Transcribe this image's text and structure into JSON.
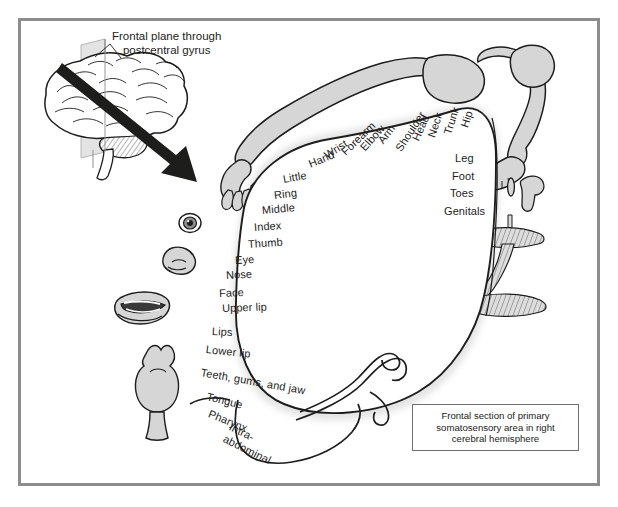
{
  "figure": {
    "type": "anatomical-diagram",
    "callout": {
      "line1": "Frontal plane through",
      "line2": "postcentral gyrus"
    },
    "caption": {
      "line1": "Frontal section of primary",
      "line2": "somatosensory area in right",
      "line3": "cerebral hemisphere"
    },
    "colors": {
      "frame": "#8d8d8d",
      "outline": "#1d1d1b",
      "body_fill": "#d6d6d6",
      "cortex_fill": "#ffffff",
      "shadow": "#e9e9e9",
      "text": "#1d1d1b"
    },
    "labels_medial": [
      {
        "text": "Hip",
        "x": 464,
        "y": 121,
        "rot": -72,
        "size": 11
      },
      {
        "text": "Trunk",
        "x": 447,
        "y": 128,
        "rot": -72,
        "size": 11
      },
      {
        "text": "Neck",
        "x": 431,
        "y": 131,
        "rot": -72,
        "size": 11
      },
      {
        "text": "Head",
        "x": 415,
        "y": 134,
        "rot": -66,
        "size": 11
      },
      {
        "text": "Shoulder",
        "x": 398,
        "y": 144,
        "rot": -57,
        "size": 11
      },
      {
        "text": "Arm",
        "x": 380,
        "y": 136,
        "rot": -52,
        "size": 11
      },
      {
        "text": "Elbow",
        "x": 362,
        "y": 143,
        "rot": -48,
        "size": 11
      },
      {
        "text": "Forearm",
        "x": 343,
        "y": 147,
        "rot": -44,
        "size": 11
      },
      {
        "text": "Wrist",
        "x": 325,
        "y": 150,
        "rot": -33,
        "size": 11
      },
      {
        "text": "Hand",
        "x": 309,
        "y": 158,
        "rot": -22,
        "size": 11
      }
    ],
    "labels_lateral_right": [
      {
        "text": "Leg",
        "x": 455,
        "y": 152,
        "rot": 0,
        "size": 11
      },
      {
        "text": "Foot",
        "x": 452,
        "y": 170,
        "rot": 0,
        "size": 11
      },
      {
        "text": "Toes",
        "x": 450,
        "y": 187,
        "rot": 0,
        "size": 11
      },
      {
        "text": "Genitals",
        "x": 444,
        "y": 205,
        "rot": 0,
        "size": 11
      }
    ],
    "labels_lateral_left": [
      {
        "text": "Little",
        "x": 283,
        "y": 173,
        "rot": -10,
        "size": 11
      },
      {
        "text": "Ring",
        "x": 274,
        "y": 189,
        "rot": -7,
        "size": 11
      },
      {
        "text": "Middle",
        "x": 262,
        "y": 204,
        "rot": -5,
        "size": 11
      },
      {
        "text": "Index",
        "x": 254,
        "y": 221,
        "rot": -4,
        "size": 11
      },
      {
        "text": "Thumb",
        "x": 248,
        "y": 238,
        "rot": -4,
        "size": 11
      },
      {
        "text": "Eye",
        "x": 235,
        "y": 254,
        "rot": -3,
        "size": 11
      },
      {
        "text": "Nose",
        "x": 226,
        "y": 269,
        "rot": -3,
        "size": 11
      },
      {
        "text": "Face",
        "x": 219,
        "y": 287,
        "rot": -2,
        "size": 11
      },
      {
        "text": "Upper lip",
        "x": 222,
        "y": 302,
        "rot": -2,
        "size": 11
      },
      {
        "text": "Lips",
        "x": 212,
        "y": 325,
        "rot": 3,
        "size": 11
      },
      {
        "text": "Lower lip",
        "x": 206,
        "y": 343,
        "rot": 6,
        "size": 11
      },
      {
        "text": "Teeth, gums, and jaw",
        "x": 201,
        "y": 366,
        "rot": 10,
        "size": 11
      },
      {
        "text": "Tongue",
        "x": 207,
        "y": 390,
        "rot": 14,
        "size": 11
      },
      {
        "text": "Pharynx",
        "x": 209,
        "y": 407,
        "rot": 22,
        "size": 11
      },
      {
        "text": "Intra-",
        "x": 230,
        "y": 420,
        "rot": 26,
        "size": 11
      },
      {
        "text": "abdominal",
        "x": 224,
        "y": 432,
        "rot": 26,
        "size": 11
      }
    ],
    "body_parts_drawn": [
      "arm-and-hand",
      "leg-and-foot",
      "genitals",
      "eye",
      "nose",
      "lips-and-mouth",
      "tongue-and-pharynx",
      "teeth-jaw-structure"
    ],
    "brain_inset": {
      "name": "lateral-brain-with-frontal-plane",
      "has_arrow": true,
      "has_plane": true
    }
  }
}
